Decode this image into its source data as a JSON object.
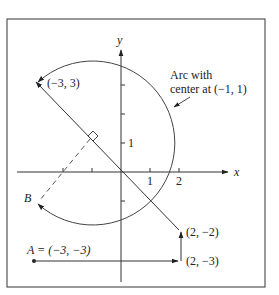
{
  "figure": {
    "axes": {
      "x_label": "x",
      "y_label": "y",
      "x_ticks": [
        "1",
        "2"
      ],
      "y_ticks": [
        "1"
      ]
    },
    "annotations": {
      "arc_note_line1": "Arc with",
      "arc_note_line2": "center at (−1, 1)",
      "point_m3_3": "(−3, 3)",
      "point_2_m2": "(2, −2)",
      "point_2_m3": "(2, −3)",
      "point_A": "A = (−3, −3)",
      "point_B": "B"
    },
    "colors": {
      "stroke": "#333333",
      "frame": "#555555"
    }
  }
}
